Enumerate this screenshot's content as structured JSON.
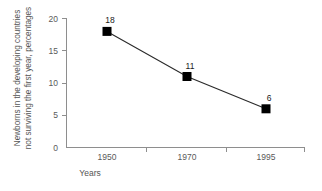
{
  "chart_data": {
    "type": "line",
    "title": "",
    "xlabel": "Years",
    "ylabel_line1": "Newborns in the developing countries",
    "ylabel_line2": "not surviving the first year, percentages",
    "categories": [
      "1950",
      "1970",
      "1995"
    ],
    "values": [
      18,
      11,
      6
    ],
    "data_labels": [
      "18",
      "11",
      "6"
    ],
    "yticks": [
      "0",
      "5",
      "10",
      "15",
      "20"
    ],
    "ytick_values": [
      0,
      5,
      10,
      15,
      20
    ],
    "xticks": [
      "1950",
      "1970",
      "1995"
    ],
    "ylim": [
      0,
      20
    ],
    "grid": false,
    "legend": false,
    "marker": "square",
    "marker_color": "#000000",
    "line_color": "#2a2a2a",
    "axis_color": "#8e8e8e",
    "text_color": "#555555",
    "background": "#ffffff"
  }
}
